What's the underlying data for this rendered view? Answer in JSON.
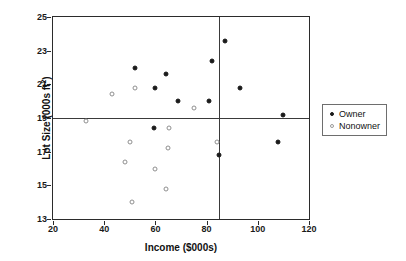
{
  "chart_data": {
    "type": "scatter",
    "title": "",
    "xlabel": "Income ($000s)",
    "ylabel": "Lot Size (000s ft²)",
    "ylabel_base": "Lot Size (000s ft",
    "ylabel_sup": "2",
    "ylabel_close": ")",
    "xlim": [
      20,
      120
    ],
    "ylim": [
      13,
      25
    ],
    "xticks": [
      20,
      40,
      60,
      80,
      100,
      120
    ],
    "yticks": [
      13,
      15,
      17,
      19,
      21,
      23,
      25
    ],
    "grid": false,
    "legend_position": "right",
    "reference_lines": [
      {
        "orientation": "horizontal",
        "value": 19,
        "axis": "y"
      },
      {
        "orientation": "vertical",
        "value": 85,
        "axis": "x"
      }
    ],
    "series": [
      {
        "name": "Owner",
        "marker": "filled-circle",
        "color": "#1a1a1a",
        "points": [
          {
            "x": 52,
            "y": 22.0
          },
          {
            "x": 59.5,
            "y": 18.4
          },
          {
            "x": 60,
            "y": 20.8
          },
          {
            "x": 64,
            "y": 21.6
          },
          {
            "x": 69,
            "y": 20.0
          },
          {
            "x": 81,
            "y": 20.0
          },
          {
            "x": 82,
            "y": 22.4
          },
          {
            "x": 85,
            "y": 16.8
          },
          {
            "x": 87,
            "y": 23.6
          },
          {
            "x": 93,
            "y": 20.8
          },
          {
            "x": 108,
            "y": 17.6
          },
          {
            "x": 110,
            "y": 19.2
          }
        ]
      },
      {
        "name": "Nonowner",
        "marker": "open-circle",
        "color": "#8f8f8f",
        "points": [
          {
            "x": 33,
            "y": 18.8
          },
          {
            "x": 43,
            "y": 20.4
          },
          {
            "x": 48,
            "y": 16.4
          },
          {
            "x": 50,
            "y": 17.6
          },
          {
            "x": 51,
            "y": 14.0
          },
          {
            "x": 52,
            "y": 20.8
          },
          {
            "x": 60,
            "y": 16.0
          },
          {
            "x": 64,
            "y": 14.8
          },
          {
            "x": 65,
            "y": 17.2
          },
          {
            "x": 65.5,
            "y": 18.4
          },
          {
            "x": 75,
            "y": 19.6
          },
          {
            "x": 84,
            "y": 17.6
          }
        ]
      }
    ]
  },
  "legend": {
    "items": [
      {
        "label": "Owner",
        "marker": "filled-circle"
      },
      {
        "label": "Nonowner",
        "marker": "open-circle"
      }
    ]
  }
}
